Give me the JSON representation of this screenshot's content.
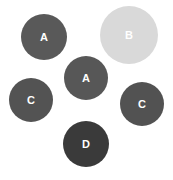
{
  "diagram": {
    "background": "#ffffff",
    "label_color": "#ffffff",
    "nodes": [
      {
        "label": "A",
        "cx": 44,
        "cy": 37,
        "r": 23,
        "color": "#595959"
      },
      {
        "label": "B",
        "cx": 129,
        "cy": 35,
        "r": 29,
        "color": "#d9d9d9"
      },
      {
        "label": "A",
        "cx": 86,
        "cy": 78,
        "r": 22,
        "color": "#575757"
      },
      {
        "label": "C",
        "cx": 31,
        "cy": 100,
        "r": 22,
        "color": "#535353"
      },
      {
        "label": "C",
        "cx": 142,
        "cy": 104,
        "r": 22,
        "color": "#525252"
      },
      {
        "label": "D",
        "cx": 86,
        "cy": 144,
        "r": 23,
        "color": "#3a3a3a"
      }
    ]
  }
}
